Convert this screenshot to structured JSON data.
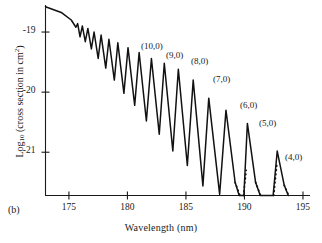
{
  "figure": {
    "panel_label": "(b)",
    "axes": {
      "x": {
        "title": "Wavelength (nm)",
        "ticks": [
          175,
          180,
          185,
          190,
          195
        ],
        "min": 173,
        "max": 195.6
      },
      "y": {
        "title_main": "Log",
        "title_sub": "10",
        "title_rest": " (cross section in cm",
        "title_sup": "2",
        "title_close": ")",
        "ticks": [
          "-19",
          "-20",
          "-21"
        ],
        "tick_values": [
          -19,
          -20,
          -21
        ],
        "min": -21.72,
        "max": -18.55
      }
    },
    "peak_labels": [
      {
        "text": "(10,0)",
        "x": 141,
        "y": 41
      },
      {
        "text": "(9,0)",
        "x": 166,
        "y": 50
      },
      {
        "text": "(8,0)",
        "x": 191,
        "y": 56
      },
      {
        "text": "(7,0)",
        "x": 213,
        "y": 74
      },
      {
        "text": "(6,0)",
        "x": 240,
        "y": 100
      },
      {
        "text": "(5,0)",
        "x": 259,
        "y": 118
      },
      {
        "text": "(4,0)",
        "x": 285,
        "y": 152
      }
    ]
  },
  "chart_data": {
    "type": "line",
    "title": "",
    "xlabel": "Wavelength (nm)",
    "ylabel": "Log10 (cross section in cm^2)",
    "xlim": [
      173,
      195.6
    ],
    "ylim": [
      -21.72,
      -18.55
    ],
    "grid": false,
    "legend": null,
    "series_name": "absorption cross section",
    "annotations": [
      "(10,0)",
      "(9,0)",
      "(8,0)",
      "(7,0)",
      "(6,0)",
      "(5,0)",
      "(4,0)"
    ],
    "vertices": [
      [
        173.0,
        -18.58
      ],
      [
        174.4,
        -18.68
      ],
      [
        175.2,
        -18.8
      ],
      [
        175.6,
        -18.92
      ],
      [
        175.75,
        -18.86
      ],
      [
        175.95,
        -19.08
      ],
      [
        176.15,
        -18.9
      ],
      [
        176.4,
        -19.16
      ],
      [
        176.62,
        -18.94
      ],
      [
        176.92,
        -19.28
      ],
      [
        177.15,
        -19.0
      ],
      [
        177.5,
        -19.44
      ],
      [
        177.75,
        -19.05
      ],
      [
        178.15,
        -19.6
      ],
      [
        178.42,
        -19.12
      ],
      [
        178.88,
        -19.8
      ],
      [
        179.18,
        -19.18
      ],
      [
        179.7,
        -20.02
      ],
      [
        180.05,
        -19.26
      ],
      [
        180.62,
        -20.22
      ],
      [
        181.0,
        -19.34
      ],
      [
        181.62,
        -20.48
      ],
      [
        182.05,
        -19.44
      ],
      [
        182.72,
        -20.7
      ],
      [
        183.15,
        -19.52
      ],
      [
        183.88,
        -20.98
      ],
      [
        184.35,
        -19.62
      ],
      [
        185.12,
        -21.22
      ],
      [
        185.62,
        -19.8
      ],
      [
        186.45,
        -21.56
      ],
      [
        186.95,
        -20.1
      ],
      [
        187.88,
        -21.7
      ],
      [
        188.42,
        -20.3
      ],
      [
        189.2,
        -21.5
      ],
      [
        189.55,
        -21.72
      ],
      [
        189.95,
        -21.72
      ],
      [
        190.25,
        -20.52
      ],
      [
        190.95,
        -21.5
      ],
      [
        191.35,
        -21.72
      ],
      [
        192.45,
        -21.72
      ],
      [
        192.8,
        -20.98
      ],
      [
        193.4,
        -21.55
      ],
      [
        193.75,
        -21.72
      ]
    ],
    "dotted_segments": [
      {
        "from": [
          189.2,
          -21.5
        ],
        "to": [
          189.62,
          -21.72
        ]
      },
      {
        "from": [
          189.92,
          -21.72
        ],
        "to": [
          190.15,
          -21.3
        ]
      },
      {
        "from": [
          190.95,
          -21.5
        ],
        "to": [
          191.38,
          -21.72
        ]
      },
      {
        "from": [
          192.5,
          -21.72
        ],
        "to": [
          192.76,
          -21.22
        ]
      },
      {
        "from": [
          193.4,
          -21.55
        ],
        "to": [
          193.78,
          -21.72
        ]
      }
    ]
  }
}
